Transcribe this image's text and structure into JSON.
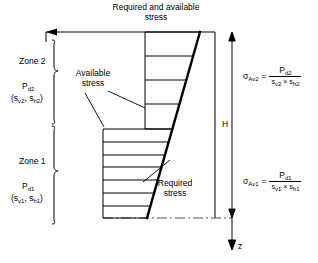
{
  "figure": {
    "title": "Required and available stress",
    "title_line1": "Required and available",
    "title_line2": "stress"
  },
  "callouts": {
    "available": {
      "line1": "Available",
      "line2": "stress"
    },
    "required": {
      "line1": "Required",
      "line2": "stress"
    }
  },
  "zones": [
    {
      "name": "Zone 2",
      "load_symbol": "P",
      "load_subscript": "d2",
      "spacing_open": "(s",
      "spacing_sub1": "v2",
      "spacing_mid": ", s",
      "spacing_sub2": "h2",
      "spacing_close": ")"
    },
    {
      "name": "Zone 1",
      "load_symbol": "P",
      "load_subscript": "d1",
      "spacing_open": "(s",
      "spacing_sub1": "v1",
      "spacing_mid": ", s",
      "spacing_sub2": "h1",
      "spacing_close": ")"
    }
  ],
  "equations": [
    {
      "lhs_symbol": "σ",
      "lhs_subscript": "Av2",
      "equals": "=",
      "numerator_symbol": "P",
      "numerator_subscript": "d2",
      "den_s1": "s",
      "den_s1_sub": "v2",
      "den_times": "×",
      "den_s2": "s",
      "den_s2_sub": "h2"
    },
    {
      "lhs_symbol": "σ",
      "lhs_subscript": "Av1",
      "equals": "=",
      "numerator_symbol": "P",
      "numerator_subscript": "d1",
      "den_s1": "s",
      "den_s1_sub": "v1",
      "den_times": "×",
      "den_s2": "s",
      "den_s2_sub": "h1"
    }
  ],
  "dimensions": {
    "height_label": "H",
    "depth_axis_label": "z"
  },
  "colors": {
    "line": "#000000",
    "background": "#ffffff",
    "dashed": "#555555"
  }
}
